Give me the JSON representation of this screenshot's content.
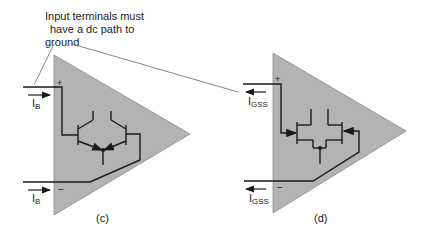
{
  "annotation": {
    "lines": [
      "Input terminals must",
      "have a dc path to",
      "ground"
    ]
  },
  "figures": [
    {
      "id": "c",
      "caption": "(c)",
      "plus_label": "+",
      "minus_label": "−",
      "current_top": {
        "main": "I",
        "sub": "B",
        "direction": "right"
      },
      "current_bottom": {
        "main": "I",
        "sub": "B",
        "direction": "right"
      },
      "device": "bipolar-differential-pair"
    },
    {
      "id": "d",
      "caption": "(d)",
      "plus_label": "+",
      "minus_label": "−",
      "current_top": {
        "main": "I",
        "sub": "GSS",
        "direction": "left"
      },
      "current_bottom": {
        "main": "I",
        "sub": "GSS",
        "direction": "left"
      },
      "device": "jfet-differential-pair"
    }
  ],
  "colors": {
    "triangle_fill": "#b3b3b3",
    "triangle_edge": "#8a8a8a",
    "wire": "#1a1a1a",
    "leader": "#666666"
  }
}
